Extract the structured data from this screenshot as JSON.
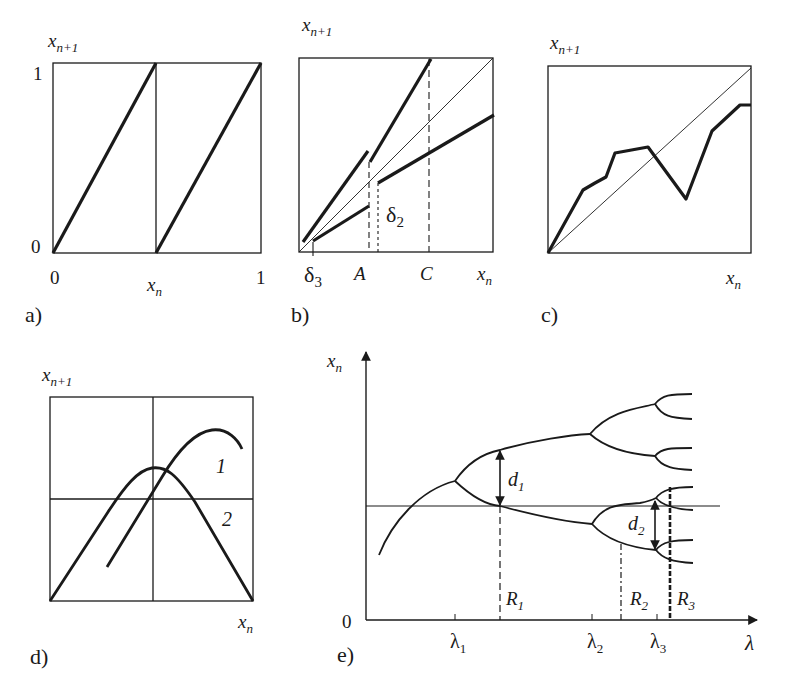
{
  "figure": {
    "panels": [
      {
        "id": "a",
        "caption": "a)",
        "y_label": "x",
        "y_label_sub": "n+1",
        "x_label": "x",
        "x_label_sub": "n",
        "y_ticks": [
          "1",
          "0"
        ],
        "x_ticks": [
          "0",
          "1"
        ],
        "description": "Sawtooth (doubling) map: two parallel rising lines from 0 to 1 over each half"
      },
      {
        "id": "b",
        "caption": "b)",
        "y_label": "x",
        "y_label_sub": "n+1",
        "x_label": "x",
        "x_label_sub": "n",
        "x_markers": [
          {
            "text": "δ",
            "sub": "3"
          },
          {
            "text": "A",
            "sub": ""
          },
          {
            "text": "C",
            "sub": ""
          }
        ],
        "annotation": {
          "text": "δ",
          "sub": "2"
        },
        "description": "Piecewise-linear map with two branches above and below the diagonal, dashed verticals at A and C"
      },
      {
        "id": "c",
        "caption": "c)",
        "y_label": "x",
        "y_label_sub": "n+1",
        "x_label": "x",
        "x_label_sub": "n",
        "description": "Irregular piecewise-linear map crossing the diagonal"
      },
      {
        "id": "d",
        "caption": "d)",
        "y_label": "x",
        "y_label_sub": "n+1",
        "x_label": "x",
        "x_label_sub": "n",
        "curve_labels": [
          "1",
          "2"
        ],
        "description": "Two unimodal (hump) maps: curve 1 shifted right and higher, curve 2 symmetric logistic-like"
      },
      {
        "id": "e",
        "caption": "e)",
        "y_label": "x",
        "y_label_sub": "n",
        "x_label": "λ",
        "origin_label": "0",
        "x_ticks": [
          {
            "text": "λ",
            "sub": "1"
          },
          {
            "text": "λ",
            "sub": "2"
          },
          {
            "text": "λ",
            "sub": "3"
          }
        ],
        "markers": [
          {
            "text": "R",
            "sub": "1"
          },
          {
            "text": "R",
            "sub": "2"
          },
          {
            "text": "R",
            "sub": "3"
          }
        ],
        "distances": [
          {
            "text": "d",
            "sub": "1"
          },
          {
            "text": "d",
            "sub": "2"
          }
        ],
        "description": "Period-doubling bifurcation diagram with superstable points R1, R2, R3 and branch separations d1, d2"
      }
    ]
  }
}
